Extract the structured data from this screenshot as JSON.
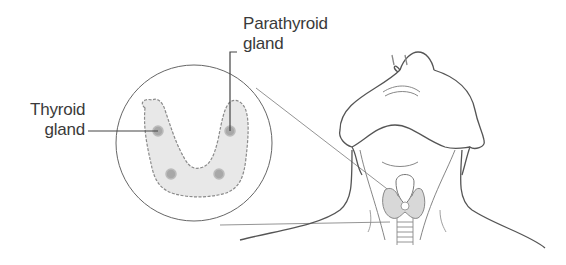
{
  "diagram": {
    "labels": {
      "thyroid": {
        "line1": "Thyroid",
        "line2": "gland"
      },
      "parathyroid": {
        "line1": "Parathyroid",
        "line2": "gland"
      }
    },
    "colors": {
      "outline": "#555555",
      "gland_fill": "#e6e6e6",
      "parathyroid_dot": "#a0a0a0",
      "text": "#3a3a3a"
    },
    "parts": [
      "magnified-thyroid-view",
      "head-outline",
      "neck-outline",
      "thyroid-on-neck",
      "trachea"
    ]
  }
}
